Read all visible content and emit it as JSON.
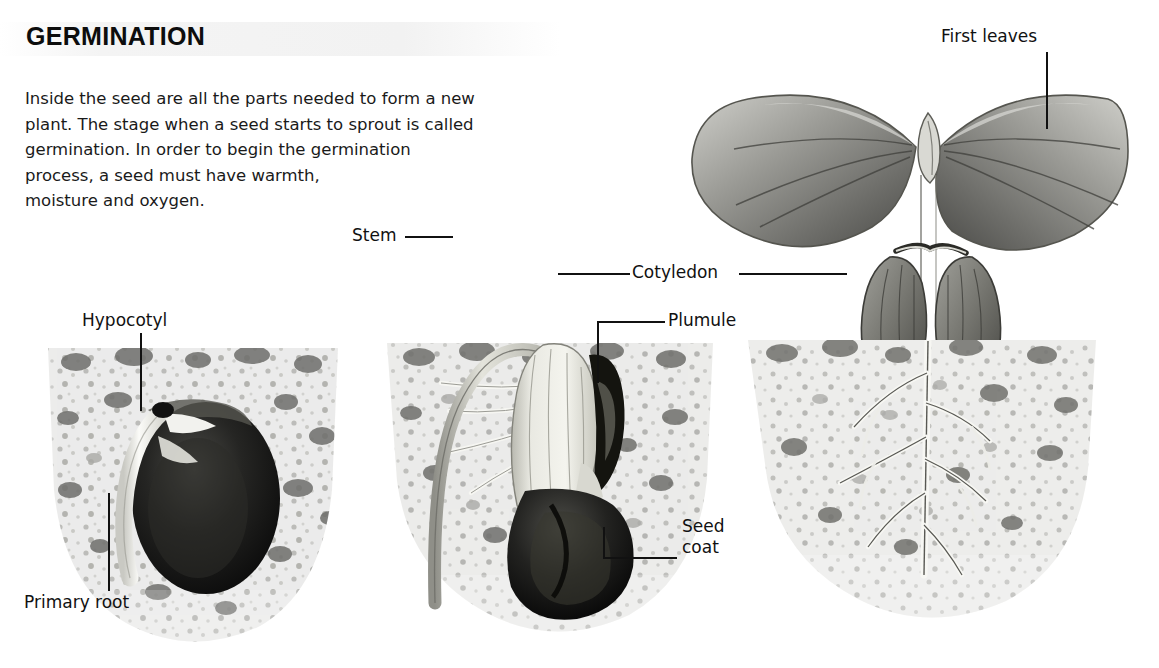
{
  "header": {
    "title": "GERMINATION",
    "body": "Inside the seed are all the parts needed to form a new\nplant. The stage when a seed starts to sprout is called\ngermination. In order to begin the germination\nprocess, a seed must have warmth,\nmoisture and oxygen."
  },
  "labels": {
    "hypocotyl": "Hypocotyl",
    "primary_root": "Primary root",
    "stem": "Stem",
    "cotyledon": "Cotyledon",
    "plumule": "Plumule",
    "seed_coat": "Seed\ncoat",
    "first_leaves": "First leaves"
  },
  "panels": [
    {
      "name": "stage-1-seed-in-soil",
      "stage": 1
    },
    {
      "name": "stage-2-sprouting",
      "stage": 2
    },
    {
      "name": "stage-3-seedling",
      "stage": 3
    }
  ],
  "colors": {
    "ink": "#111111",
    "soil_base": "#e8e8e6",
    "soil_speckle_mid": "#9a9a98",
    "soil_speckle_dark": "#5a5a58",
    "seed_dark": "#131313",
    "seed_mid": "#3a3a38",
    "sprout_pale": "#dcdcd6",
    "leaf_mid": "#8e8e8a",
    "leaf_dark": "#4e4e4c",
    "title_band": "#f2f2f2"
  }
}
